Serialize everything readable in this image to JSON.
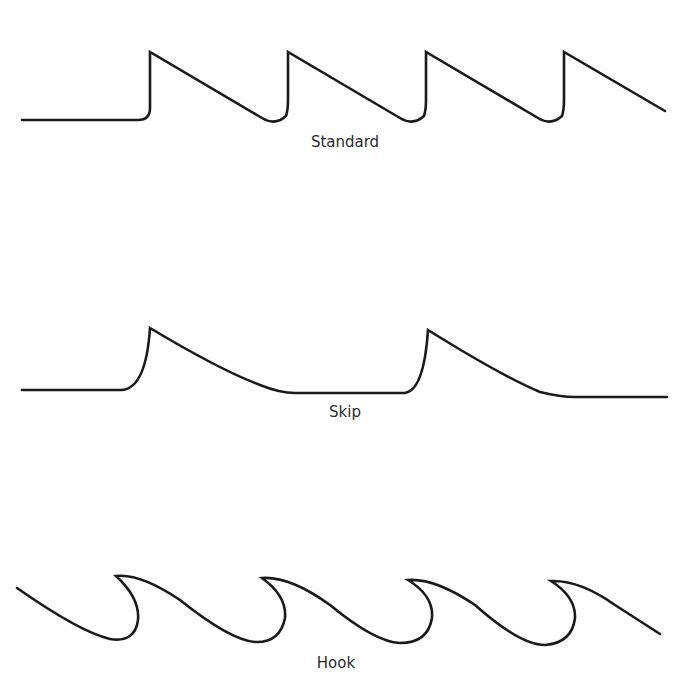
{
  "diagram": {
    "type": "saw tooth profiles",
    "stroke_color": "#1a1a1a",
    "background": "#ffffff",
    "profiles": [
      {
        "name": "standard",
        "label": "Standard"
      },
      {
        "name": "skip",
        "label": "Skip"
      },
      {
        "name": "hook",
        "label": "Hook"
      }
    ]
  }
}
